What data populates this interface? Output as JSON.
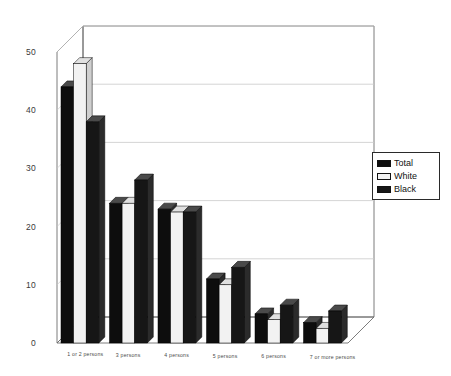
{
  "chart_data": {
    "type": "bar",
    "title": "",
    "subtitle": "",
    "xlabel": "",
    "ylabel": "",
    "ylim": [
      0,
      50
    ],
    "yticks": [
      0,
      10,
      20,
      30,
      40,
      50
    ],
    "grid": true,
    "legend_position": "right",
    "style": "3d-clustered-column",
    "categories": [
      "1 or 2 persons",
      "3 persons",
      "4 persons",
      "5 persons",
      "6 persons",
      "7 or more persons"
    ],
    "series": [
      {
        "name": "Total",
        "color": "#0d0d0d",
        "values": [
          44,
          24,
          23,
          11,
          5,
          3.5
        ]
      },
      {
        "name": "White",
        "color": "#f2f2f2",
        "values": [
          48,
          24,
          22.5,
          10,
          4,
          2.5
        ]
      },
      {
        "name": "Black",
        "color": "#161616",
        "values": [
          38,
          28,
          22.5,
          13,
          6.5,
          5.5
        ]
      }
    ]
  },
  "legend": {
    "items": [
      {
        "label": "Total",
        "swatch": "sw-total"
      },
      {
        "label": "White",
        "swatch": "sw-white"
      },
      {
        "label": "Black",
        "swatch": "sw-black"
      }
    ]
  },
  "axes": {
    "y_tick_labels": [
      "50",
      "40",
      "30",
      "20",
      "10",
      "0"
    ],
    "x_tick_labels": [
      "1 or 2 persons",
      "3 persons",
      "4 persons",
      "5 persons",
      "6 persons",
      "7 or more persons"
    ]
  },
  "colors": {
    "background": "#ffffff",
    "axis_line": "#6e6e6e",
    "grid_line": "#c9c9c9",
    "bar_front_dark": "#0d0d0d",
    "bar_front_light": "#f2f2f2",
    "bar_side": "#2b2b2b",
    "bar_top": "#4a4a4a",
    "legend_border": "#2a2a2a",
    "text": "#3a3a3a"
  }
}
